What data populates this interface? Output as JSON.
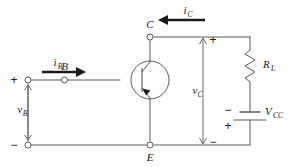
{
  "figure": {
    "stroke_color": "#5a5a5a",
    "text_color": "#1a1a1a",
    "background": "#ffffff",
    "width": 289,
    "height": 167
  },
  "nodes": {
    "base": {
      "label": "B",
      "terminal": "open-circle"
    },
    "collector": {
      "label": "C",
      "terminal": "open-circle"
    },
    "emitter": {
      "label": "E",
      "terminal": "open-circle"
    },
    "input_plus": {
      "label": "+",
      "terminal": "open-circle"
    },
    "input_minus": {
      "label": "−",
      "terminal": "open-circle"
    }
  },
  "currents": {
    "base_current": {
      "symbol": "i",
      "subscript": "B",
      "direction": "right"
    },
    "collector_current": {
      "symbol": "i",
      "subscript": "C",
      "direction": "left"
    }
  },
  "voltages": {
    "base_voltage": {
      "symbol": "v",
      "subscript": "B",
      "plus": "+",
      "minus": "−",
      "arrow": "double-headed-vertical"
    },
    "collector_voltage": {
      "symbol": "v",
      "subscript": "C",
      "plus": "+",
      "minus": "−",
      "arrow": "double-headed-vertical"
    }
  },
  "components": {
    "transistor": {
      "type": "bipolar-junction-transistor",
      "envelope": "circle",
      "emitter_arrow": "filled-triangle"
    },
    "load_resistor": {
      "symbol": "R",
      "subscript": "L",
      "style": "zigzag"
    },
    "supply": {
      "symbol": "V",
      "subscript": "CC",
      "style": "battery-cell",
      "top_sign": "−",
      "bottom_sign": "+"
    }
  }
}
